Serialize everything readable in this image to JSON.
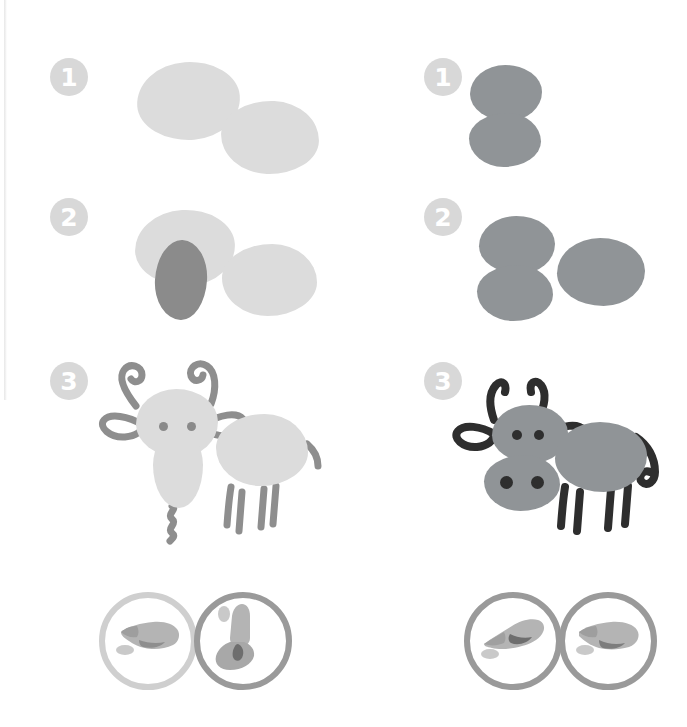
{
  "page": {
    "background_color": "#ffffff",
    "width": 687,
    "height": 727
  },
  "palette": {
    "badge_fill": "#d8d8d8",
    "badge_text": "#ffffff",
    "light_blob": "#dcdcdc",
    "light_blob_alt": "#d7d7d7",
    "dark_blob_left": "#8b8b8b",
    "mid_blob_right": "#909497",
    "outline_left": "#8e8e8e",
    "outline_right": "#2e2e2e",
    "eye_dark": "#3a3a3a",
    "ring_light": "#cfcfcf",
    "ring_mid": "#9a9a9a",
    "skin": "#a8a8a8"
  },
  "columns": [
    {
      "id": "goat",
      "name": "goat-tutorial",
      "side": "left",
      "animal_label": "Goat",
      "ink_color": "#dcdcdc",
      "accent_color": "#8b8b8b",
      "steps": [
        {
          "number": "1",
          "badge_label": "1",
          "description": "Two light fingerprint ovals side by side for head and body",
          "prints": 2
        },
        {
          "number": "2",
          "badge_label": "2",
          "description": "Add a darker vertical oval print for the long snout",
          "prints": 3
        },
        {
          "number": "3",
          "badge_label": "3",
          "description": "Draw curly horns, leaf ears, eyes, legs, tail and beard",
          "prints": 3
        }
      ]
    },
    {
      "id": "cow",
      "name": "cow-tutorial",
      "side": "right",
      "animal_label": "Cow",
      "ink_color": "#909497",
      "accent_color": "#2e2e2e",
      "steps": [
        {
          "number": "1",
          "badge_label": "1",
          "description": "Two stacked fingerprint ovals for the head and muzzle",
          "prints": 2
        },
        {
          "number": "2",
          "badge_label": "2",
          "description": "Add a wide oval print beside them for the body",
          "prints": 3
        },
        {
          "number": "3",
          "badge_label": "3",
          "description": "Draw dark horns, ear loops, nostrils, eyes, legs and tail",
          "prints": 3
        }
      ]
    }
  ],
  "hand_guides": {
    "left": [
      {
        "name": "finger-pad-flat",
        "ring_color": "#cfcfcf",
        "pose": "index finger pressed flat on its pad"
      },
      {
        "name": "finger-tip-upright",
        "ring_color": "#9a9a9a",
        "pose": "index finger pointing up, tip print"
      }
    ],
    "right": [
      {
        "name": "finger-pointing-down",
        "ring_color": "#9a9a9a",
        "pose": "index finger pointing down-left"
      },
      {
        "name": "finger-pad-flat",
        "ring_color": "#9a9a9a",
        "pose": "index finger pressed flat on its pad"
      }
    ]
  }
}
